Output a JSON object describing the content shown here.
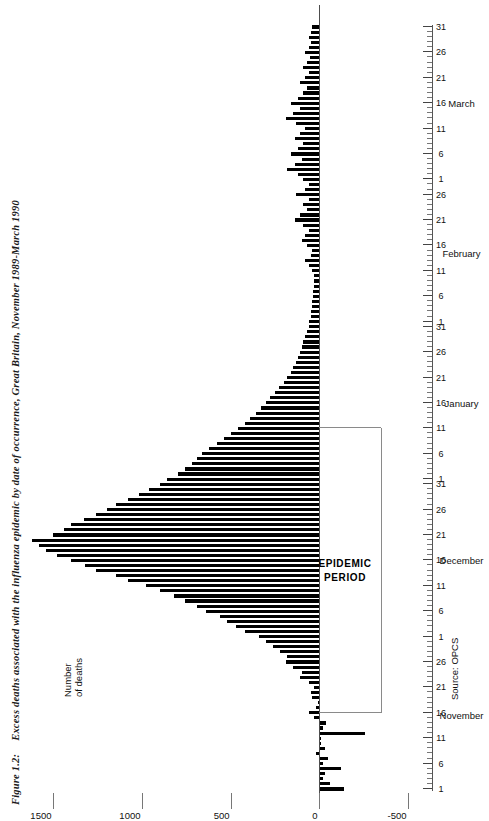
{
  "figure": {
    "number": "Figure 1.2:",
    "title": "Excess deaths associated with the influenza epidemic by date of occurrence, Great Britain, November 1989-March 1990",
    "source": "Source: OPCS"
  },
  "axes": {
    "value_axis_title_line1": "Number",
    "value_axis_title_line2": "of deaths",
    "value_ticks": [
      "1500",
      "1000",
      "500",
      "0",
      "-500"
    ],
    "value_tick_numbers": [
      1500,
      1000,
      500,
      0,
      -500
    ],
    "value_limits": [
      -500,
      1700
    ],
    "time_axis_label": "",
    "months": [
      {
        "name": "November",
        "days": 30,
        "day_ticks": [
          "1",
          "6",
          "11",
          "16",
          "21",
          "26"
        ]
      },
      {
        "name": "December",
        "days": 31,
        "day_ticks": [
          "1",
          "6",
          "11",
          "16",
          "21",
          "26",
          "31"
        ]
      },
      {
        "name": "January",
        "days": 31,
        "day_ticks": [
          "1",
          "6",
          "11",
          "16",
          "21",
          "26",
          "31"
        ]
      },
      {
        "name": "February",
        "days": 28,
        "day_ticks": [
          "1",
          "6",
          "11",
          "16",
          "21",
          "26"
        ]
      },
      {
        "name": "March",
        "days": 31,
        "day_ticks": [
          "1",
          "6",
          "11",
          "16",
          "21",
          "26",
          "31"
        ]
      }
    ]
  },
  "annotation": {
    "epidemic_label_line1": "EPIDEMIC",
    "epidemic_label_line2": "PERIOD",
    "epidemic_start_day_index": 15,
    "epidemic_end_day_index": 71
  },
  "chart_data": {
    "type": "bar",
    "title": "Excess deaths associated with the influenza epidemic by date of occurrence, Great Britain, November 1989-March 1990",
    "xlabel": "",
    "ylabel": "Number of deaths",
    "ylim": [
      -500,
      1700
    ],
    "grid": false,
    "legend": "none",
    "orientation": "horizontal-rotated",
    "x_start_date": "1989-11-01",
    "x_end_date": "1990-03-31",
    "categories": [
      "Nov 1",
      "Nov 2",
      "Nov 3",
      "Nov 4",
      "Nov 5",
      "Nov 6",
      "Nov 7",
      "Nov 8",
      "Nov 9",
      "Nov 10",
      "Nov 11",
      "Nov 12",
      "Nov 13",
      "Nov 14",
      "Nov 15",
      "Nov 16",
      "Nov 17",
      "Nov 18",
      "Nov 19",
      "Nov 20",
      "Nov 21",
      "Nov 22",
      "Nov 23",
      "Nov 24",
      "Nov 25",
      "Nov 26",
      "Nov 27",
      "Nov 28",
      "Nov 29",
      "Nov 30",
      "Dec 1",
      "Dec 2",
      "Dec 3",
      "Dec 4",
      "Dec 5",
      "Dec 6",
      "Dec 7",
      "Dec 8",
      "Dec 9",
      "Dec 10",
      "Dec 11",
      "Dec 12",
      "Dec 13",
      "Dec 14",
      "Dec 15",
      "Dec 16",
      "Dec 17",
      "Dec 18",
      "Dec 19",
      "Dec 20",
      "Dec 21",
      "Dec 22",
      "Dec 23",
      "Dec 24",
      "Dec 25",
      "Dec 26",
      "Dec 27",
      "Dec 28",
      "Dec 29",
      "Dec 30",
      "Dec 31",
      "Jan 1",
      "Jan 2",
      "Jan 3",
      "Jan 4",
      "Jan 5",
      "Jan 6",
      "Jan 7",
      "Jan 8",
      "Jan 9",
      "Jan 10",
      "Jan 11",
      "Jan 12",
      "Jan 13",
      "Jan 14",
      "Jan 15",
      "Jan 16",
      "Jan 17",
      "Jan 18",
      "Jan 19",
      "Jan 20",
      "Jan 21",
      "Jan 22",
      "Jan 23",
      "Jan 24",
      "Jan 25",
      "Jan 26",
      "Jan 27",
      "Jan 28",
      "Jan 29",
      "Jan 30",
      "Jan 31",
      "Feb 1",
      "Feb 2",
      "Feb 3",
      "Feb 4",
      "Feb 5",
      "Feb 6",
      "Feb 7",
      "Feb 8",
      "Feb 9",
      "Feb 10",
      "Feb 11",
      "Feb 12",
      "Feb 13",
      "Feb 14",
      "Feb 15",
      "Feb 16",
      "Feb 17",
      "Feb 18",
      "Feb 19",
      "Feb 20",
      "Feb 21",
      "Feb 22",
      "Feb 23",
      "Feb 24",
      "Feb 25",
      "Feb 26",
      "Feb 27",
      "Feb 28",
      "Mar 1",
      "Mar 2",
      "Mar 3",
      "Mar 4",
      "Mar 5",
      "Mar 6",
      "Mar 7",
      "Mar 8",
      "Mar 9",
      "Mar 10",
      "Mar 11",
      "Mar 12",
      "Mar 13",
      "Mar 14",
      "Mar 15",
      "Mar 16",
      "Mar 17",
      "Mar 18",
      "Mar 19",
      "Mar 20",
      "Mar 21",
      "Mar 22",
      "Mar 23",
      "Mar 24",
      "Mar 25",
      "Mar 26",
      "Mar 27",
      "Mar 28",
      "Mar 29",
      "Mar 30",
      "Mar 31"
    ],
    "values": [
      -140,
      -60,
      -20,
      -30,
      -120,
      -20,
      -50,
      20,
      -30,
      -10,
      -10,
      -260,
      -20,
      -40,
      30,
      60,
      20,
      10,
      40,
      50,
      30,
      60,
      110,
      100,
      150,
      190,
      180,
      220,
      260,
      300,
      340,
      420,
      470,
      520,
      560,
      640,
      690,
      760,
      820,
      900,
      980,
      1080,
      1150,
      1260,
      1320,
      1400,
      1480,
      1540,
      1580,
      1620,
      1500,
      1440,
      1400,
      1330,
      1260,
      1200,
      1150,
      1080,
      1020,
      960,
      900,
      860,
      800,
      760,
      720,
      690,
      660,
      620,
      580,
      540,
      500,
      460,
      420,
      390,
      360,
      330,
      300,
      280,
      250,
      230,
      200,
      180,
      160,
      150,
      130,
      120,
      110,
      100,
      90,
      80,
      70,
      60,
      60,
      50,
      45,
      40,
      40,
      35,
      35,
      30,
      30,
      30,
      40,
      60,
      80,
      50,
      40,
      70,
      100,
      80,
      60,
      90,
      140,
      110,
      70,
      90,
      60,
      130,
      80,
      60,
      90,
      120,
      180,
      140,
      100,
      160,
      120,
      90,
      140,
      110,
      80,
      130,
      190,
      150,
      110,
      160,
      120,
      90,
      70,
      110,
      80,
      60,
      90,
      70,
      55,
      80,
      60,
      45,
      60,
      50,
      40
    ]
  }
}
